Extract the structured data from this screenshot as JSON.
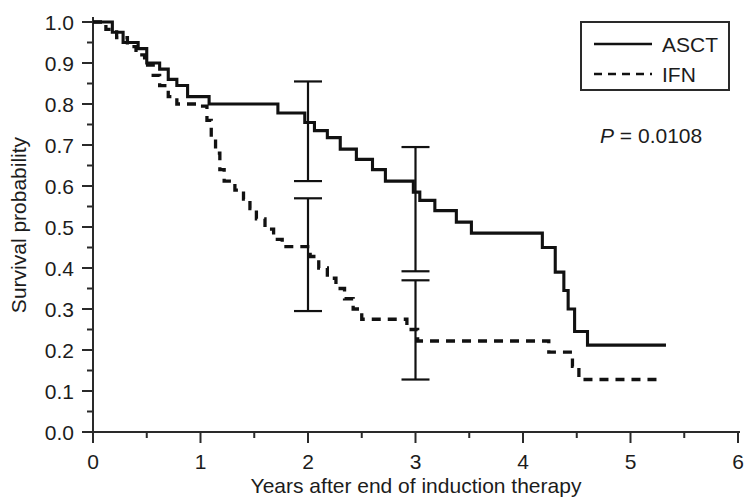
{
  "chart_data": {
    "type": "line",
    "subtype": "kaplan-meier-step",
    "title": "",
    "xlabel": "Years after end of induction therapy",
    "ylabel": "Survival probability",
    "xlim": [
      0,
      6
    ],
    "ylim": [
      0.0,
      1.0
    ],
    "xticks": [
      0,
      1,
      2,
      3,
      4,
      5,
      6
    ],
    "xtick_labels": [
      "0",
      "1",
      "2",
      "3",
      "4",
      "5",
      "6"
    ],
    "xticks_minor": [
      0.5,
      1.5,
      2.5,
      3.5,
      4.5,
      5.5
    ],
    "yticks": [
      0.0,
      0.1,
      0.2,
      0.3,
      0.4,
      0.5,
      0.6,
      0.7,
      0.8,
      0.9,
      1.0
    ],
    "ytick_labels": [
      "0.0",
      "0.1",
      "0.2",
      "0.3",
      "0.4",
      "0.5",
      "0.6",
      "0.7",
      "0.8",
      "0.9",
      "1.0"
    ],
    "yticks_minor": [
      0.05,
      0.15,
      0.25,
      0.35,
      0.45,
      0.55,
      0.65,
      0.75,
      0.85,
      0.95
    ],
    "grid": false,
    "legend_position": "top-right",
    "annotation": {
      "p_symbol": "P",
      "p_relation": " = ",
      "p_value": "0.0108",
      "p_text": "P = 0.0108"
    },
    "series": [
      {
        "name": "ASCT",
        "style": "solid",
        "color": "#111111",
        "points": [
          [
            0.0,
            1.0
          ],
          [
            0.18,
            1.0
          ],
          [
            0.18,
            0.975
          ],
          [
            0.28,
            0.975
          ],
          [
            0.28,
            0.95
          ],
          [
            0.42,
            0.95
          ],
          [
            0.42,
            0.935
          ],
          [
            0.5,
            0.935
          ],
          [
            0.5,
            0.9
          ],
          [
            0.62,
            0.9
          ],
          [
            0.62,
            0.885
          ],
          [
            0.7,
            0.885
          ],
          [
            0.7,
            0.86
          ],
          [
            0.78,
            0.86
          ],
          [
            0.78,
            0.845
          ],
          [
            0.88,
            0.845
          ],
          [
            0.88,
            0.818
          ],
          [
            1.08,
            0.818
          ],
          [
            1.08,
            0.8
          ],
          [
            1.72,
            0.8
          ],
          [
            1.72,
            0.778
          ],
          [
            1.97,
            0.778
          ],
          [
            1.97,
            0.755
          ],
          [
            2.06,
            0.755
          ],
          [
            2.06,
            0.735
          ],
          [
            2.18,
            0.735
          ],
          [
            2.18,
            0.718
          ],
          [
            2.3,
            0.718
          ],
          [
            2.3,
            0.69
          ],
          [
            2.45,
            0.69
          ],
          [
            2.45,
            0.665
          ],
          [
            2.6,
            0.665
          ],
          [
            2.6,
            0.64
          ],
          [
            2.72,
            0.64
          ],
          [
            2.72,
            0.612
          ],
          [
            2.98,
            0.612
          ],
          [
            2.98,
            0.585
          ],
          [
            3.04,
            0.585
          ],
          [
            3.04,
            0.565
          ],
          [
            3.18,
            0.565
          ],
          [
            3.18,
            0.54
          ],
          [
            3.38,
            0.54
          ],
          [
            3.38,
            0.512
          ],
          [
            3.52,
            0.512
          ],
          [
            3.52,
            0.485
          ],
          [
            4.18,
            0.485
          ],
          [
            4.18,
            0.45
          ],
          [
            4.3,
            0.45
          ],
          [
            4.3,
            0.39
          ],
          [
            4.38,
            0.39
          ],
          [
            4.38,
            0.345
          ],
          [
            4.42,
            0.345
          ],
          [
            4.42,
            0.3
          ],
          [
            4.48,
            0.3
          ],
          [
            4.48,
            0.245
          ],
          [
            4.6,
            0.245
          ],
          [
            4.6,
            0.212
          ],
          [
            5.33,
            0.212
          ]
        ]
      },
      {
        "name": "IFN",
        "style": "dashed",
        "color": "#111111",
        "points": [
          [
            0.0,
            1.0
          ],
          [
            0.12,
            1.0
          ],
          [
            0.12,
            0.982
          ],
          [
            0.22,
            0.982
          ],
          [
            0.22,
            0.962
          ],
          [
            0.32,
            0.962
          ],
          [
            0.32,
            0.94
          ],
          [
            0.4,
            0.94
          ],
          [
            0.4,
            0.92
          ],
          [
            0.48,
            0.92
          ],
          [
            0.48,
            0.895
          ],
          [
            0.56,
            0.895
          ],
          [
            0.56,
            0.87
          ],
          [
            0.62,
            0.87
          ],
          [
            0.62,
            0.845
          ],
          [
            0.7,
            0.845
          ],
          [
            0.7,
            0.818
          ],
          [
            0.78,
            0.818
          ],
          [
            0.78,
            0.8
          ],
          [
            1.0,
            0.8
          ],
          [
            1.0,
            0.795
          ],
          [
            1.06,
            0.795
          ],
          [
            1.06,
            0.76
          ],
          [
            1.1,
            0.76
          ],
          [
            1.1,
            0.72
          ],
          [
            1.14,
            0.72
          ],
          [
            1.14,
            0.68
          ],
          [
            1.18,
            0.68
          ],
          [
            1.18,
            0.64
          ],
          [
            1.22,
            0.64
          ],
          [
            1.22,
            0.612
          ],
          [
            1.32,
            0.612
          ],
          [
            1.32,
            0.59
          ],
          [
            1.4,
            0.59
          ],
          [
            1.4,
            0.568
          ],
          [
            1.46,
            0.568
          ],
          [
            1.46,
            0.545
          ],
          [
            1.52,
            0.545
          ],
          [
            1.52,
            0.52
          ],
          [
            1.6,
            0.52
          ],
          [
            1.6,
            0.495
          ],
          [
            1.68,
            0.495
          ],
          [
            1.68,
            0.47
          ],
          [
            1.76,
            0.47
          ],
          [
            1.76,
            0.452
          ],
          [
            2.02,
            0.452
          ],
          [
            2.02,
            0.428
          ],
          [
            2.1,
            0.428
          ],
          [
            2.1,
            0.4
          ],
          [
            2.18,
            0.4
          ],
          [
            2.18,
            0.375
          ],
          [
            2.26,
            0.375
          ],
          [
            2.26,
            0.35
          ],
          [
            2.34,
            0.35
          ],
          [
            2.34,
            0.325
          ],
          [
            2.42,
            0.325
          ],
          [
            2.42,
            0.3
          ],
          [
            2.5,
            0.3
          ],
          [
            2.5,
            0.275
          ],
          [
            2.92,
            0.275
          ],
          [
            2.92,
            0.25
          ],
          [
            3.02,
            0.25
          ],
          [
            3.02,
            0.222
          ],
          [
            4.24,
            0.222
          ],
          [
            4.24,
            0.195
          ],
          [
            4.46,
            0.195
          ],
          [
            4.46,
            0.16
          ],
          [
            4.52,
            0.16
          ],
          [
            4.52,
            0.128
          ],
          [
            5.3,
            0.128
          ]
        ]
      }
    ],
    "error_bars": [
      {
        "series": "ASCT",
        "x": 2.0,
        "estimate": 0.735,
        "lower": 0.612,
        "upper": 0.855
      },
      {
        "series": "IFN",
        "x": 2.0,
        "estimate": 0.44,
        "lower": 0.295,
        "upper": 0.57
      },
      {
        "series": "ASCT",
        "x": 3.0,
        "estimate": 0.545,
        "lower": 0.392,
        "upper": 0.695
      },
      {
        "series": "IFN",
        "x": 3.0,
        "estimate": 0.225,
        "lower": 0.128,
        "upper": 0.37
      }
    ]
  },
  "axes": {
    "y_title": "Survival probability",
    "x_title": "Years after end of induction therapy",
    "y_labels": {
      "t10": "1.0",
      "t9": "0.9",
      "t8": "0.8",
      "t7": "0.7",
      "t6": "0.6",
      "t5": "0.5",
      "t4": "0.4",
      "t3": "0.3",
      "t2": "0.2",
      "t1": "0.1",
      "t0": "0.0"
    },
    "x_labels": {
      "t0": "0",
      "t1": "1",
      "t2": "2",
      "t3": "3",
      "t4": "4",
      "t5": "5",
      "t6": "6"
    }
  },
  "legend": {
    "entries": [
      {
        "label": "ASCT",
        "style": "solid"
      },
      {
        "label": "IFN",
        "style": "dashed"
      }
    ],
    "item1_label": "ASCT",
    "item2_label": "IFN"
  },
  "annotation": {
    "p_symbol": "P",
    "p_rest": " = 0.0108"
  },
  "colors": {
    "curve": "#111111",
    "axis": "#2a2a2a",
    "text": "#1c1c1c",
    "background": "#ffffff"
  }
}
